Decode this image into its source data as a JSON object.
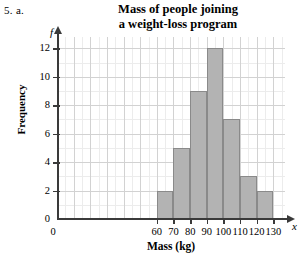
{
  "problem": {
    "label": "5. a."
  },
  "chart_data": {
    "type": "bar",
    "title": "Mass of people joining a weight-loss program",
    "title_lines": [
      "Mass of people joining",
      "a weight-loss program"
    ],
    "xlabel": "Mass (kg)",
    "ylabel": "Frequency",
    "x_variable": "x",
    "y_variable": "f",
    "categories": [
      "60-70",
      "70-80",
      "80-90",
      "90-100",
      "100-110",
      "110-120",
      "120-130"
    ],
    "bin_edges": [
      60,
      70,
      80,
      90,
      100,
      110,
      120,
      130
    ],
    "values": [
      2,
      5,
      9,
      12,
      7,
      3,
      2
    ],
    "xlim": [
      0,
      137
    ],
    "ylim": [
      0,
      12.8
    ],
    "x_ticks": [
      0,
      60,
      70,
      80,
      90,
      100,
      110,
      120,
      130
    ],
    "x_tick_labels": [
      "0",
      "60",
      "70",
      "80",
      "90",
      "100",
      "110",
      "120",
      "130"
    ],
    "y_ticks": [
      0,
      2,
      4,
      6,
      8,
      10,
      12
    ],
    "y_tick_labels": [
      "0",
      "2",
      "4",
      "6",
      "8",
      "10",
      "12"
    ],
    "grid": true,
    "grid_major_x_step": 10,
    "grid_major_y_step": 2,
    "grid_minor_x_step": 5,
    "grid_minor_y_step": 1,
    "legend": false,
    "bar_fill": "#b3b3b3",
    "bar_stroke": "#8a8a8a",
    "grid_major_color": "#d2d2d2",
    "grid_minor_color": "#ececec",
    "axis_color": "#3a3a3a"
  }
}
